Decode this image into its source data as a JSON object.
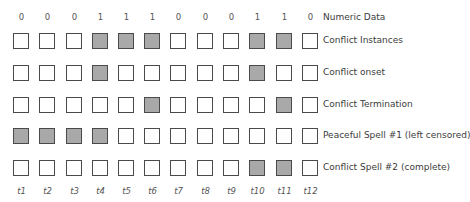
{
  "figure": {
    "numeric_label": "Numeric Data",
    "numeric_values": [
      "0",
      "0",
      "0",
      "1",
      "1",
      "1",
      "0",
      "0",
      "0",
      "1",
      "1",
      "0"
    ],
    "time_labels": [
      "t1",
      "t2",
      "t3",
      "t4",
      "t5",
      "t6",
      "t7",
      "t8",
      "t9",
      "t10",
      "t11",
      "t12"
    ],
    "colors": {
      "filled": "#a9a9a9",
      "empty": "#ffffff",
      "border": "#4a4a4a"
    },
    "rows": [
      {
        "label": "Conflict Instances",
        "cells": [
          0,
          0,
          0,
          1,
          1,
          1,
          0,
          0,
          0,
          1,
          1,
          0
        ]
      },
      {
        "label": "Conflict onset",
        "cells": [
          0,
          0,
          0,
          1,
          0,
          0,
          0,
          0,
          0,
          1,
          0,
          0
        ]
      },
      {
        "label": "Conflict Termination",
        "cells": [
          0,
          0,
          0,
          0,
          0,
          1,
          0,
          0,
          0,
          0,
          1,
          0
        ]
      },
      {
        "label": "Peaceful Spell #1 (left censored)",
        "cells": [
          1,
          1,
          1,
          1,
          0,
          0,
          0,
          0,
          0,
          0,
          0,
          0
        ]
      },
      {
        "label": "Conflict Spell #2 (complete)",
        "cells": [
          0,
          0,
          0,
          0,
          0,
          0,
          0,
          0,
          0,
          1,
          1,
          0
        ]
      }
    ]
  }
}
